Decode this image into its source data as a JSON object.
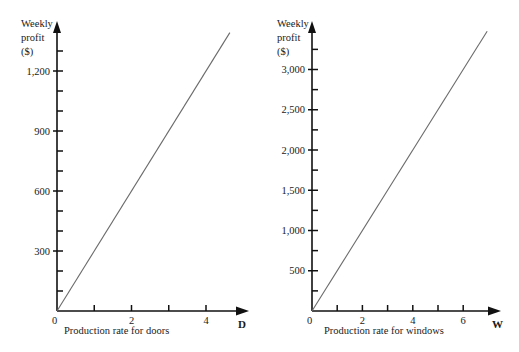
{
  "chart_data": [
    {
      "type": "line",
      "title": "",
      "ylabel": [
        "Weekly",
        "profit",
        "($)"
      ],
      "xlabel": "Production rate for doors",
      "x_axis_name": "D",
      "x_ticks_major": [
        0,
        2,
        4
      ],
      "x_ticks_minor": [
        1,
        3
      ],
      "y_ticks_labeled": [
        300,
        600,
        900,
        1200
      ],
      "y_tick_labels": [
        "300",
        "600",
        "900",
        "1,200"
      ],
      "y_minor_step": 100,
      "xlim": [
        0,
        5
      ],
      "ylim": [
        0,
        1450
      ],
      "grid": false,
      "series": [
        {
          "name": "Weekly profit = 300D",
          "x": [
            0,
            4.64
          ],
          "y": [
            0,
            1392
          ]
        }
      ]
    },
    {
      "type": "line",
      "title": "",
      "ylabel": [
        "Weekly",
        "profit",
        "($)"
      ],
      "xlabel": "Production rate for windows",
      "x_axis_name": "W",
      "x_ticks_major": [
        0,
        2,
        4,
        6
      ],
      "x_ticks_minor": [
        1,
        3,
        5
      ],
      "y_ticks_labeled": [
        500,
        1000,
        1500,
        2000,
        2500,
        3000
      ],
      "y_tick_labels": [
        "500",
        "1,000",
        "1,500",
        "2,000",
        "2,500",
        "3,000"
      ],
      "y_minor_step": 250,
      "xlim": [
        0,
        7.5
      ],
      "ylim": [
        0,
        3600
      ],
      "grid": false,
      "series": [
        {
          "name": "Weekly profit = 500W",
          "x": [
            0,
            6.95
          ],
          "y": [
            0,
            3475
          ]
        }
      ]
    }
  ],
  "left": {
    "y_label_lines": [
      "Weekly",
      "profit",
      "($)"
    ],
    "x_label": "Production rate for doors",
    "axis_name": "D",
    "origin_label": "0"
  },
  "right": {
    "y_label_lines": [
      "Weekly",
      "profit",
      "($)"
    ],
    "x_label": "Production rate for windows",
    "axis_name": "W",
    "origin_label": "0"
  },
  "colors": {
    "axis": "#111111",
    "line": "#6a6a6a",
    "text": "#1a1a1a"
  }
}
